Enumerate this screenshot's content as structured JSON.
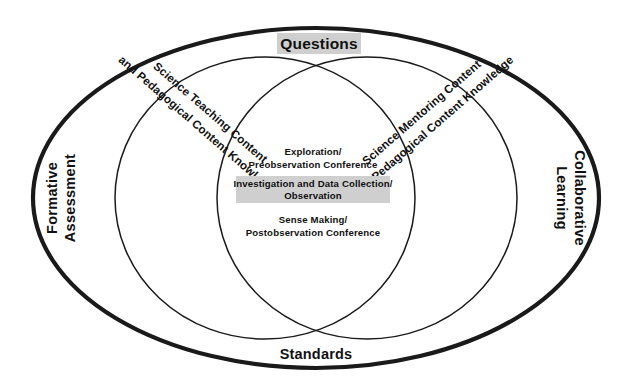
{
  "diagram": {
    "title_top": "Questions",
    "title_bottom": "Standards",
    "left_side_label_line1": "Formative",
    "left_side_label_line2": "Assessment",
    "right_side_label_line1": "Collaborative",
    "right_side_label_line2": "Learning",
    "left_circle": {
      "line1": "Science Teaching Content",
      "line2": "and Pedagogical Content Knowledge"
    },
    "right_circle": {
      "line1": "Science Mentoring Content",
      "line2": "and Pedagogical Content Knowledge"
    },
    "center_items": [
      {
        "line1": "Exploration/",
        "line2": "Preobservation Conference",
        "highlighted": false
      },
      {
        "line1": "Investigation and Data Collection/",
        "line2": "Observation",
        "highlighted": true
      },
      {
        "line1": "Sense Making/",
        "line2": "Postobservation Conference",
        "highlighted": false
      }
    ],
    "colors": {
      "stroke": "#1a1a1a",
      "highlight": "#cfcfcf",
      "text": "#111111",
      "background": "#ffffff"
    }
  }
}
